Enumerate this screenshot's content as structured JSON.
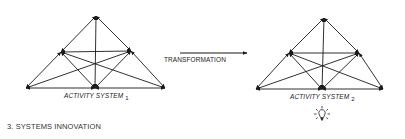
{
  "figure": {
    "caption": "3. SYSTEMS INNOVATION",
    "transformation_label": "TRANSFORMATION",
    "icon": "lightbulb-icon",
    "line_color": "#1a1a1a"
  },
  "systems": [
    {
      "label": "ACTIVITY SYSTEM",
      "subscript": "1",
      "nodes": {
        "apex": [
          96,
          16
        ],
        "mid_left": [
          61,
          52
        ],
        "mid_right": [
          131,
          51
        ],
        "base_left": [
          26,
          88
        ],
        "base_center": [
          95,
          88
        ],
        "base_right": [
          165,
          88
        ]
      }
    },
    {
      "label": "ACTIVITY SYSTEM",
      "subscript": "2",
      "nodes": {
        "apex": [
          324,
          18
        ],
        "mid_left": [
          289,
          53
        ],
        "mid_right": [
          359,
          53
        ],
        "base_left": [
          256,
          89
        ],
        "base_center": [
          322,
          89
        ],
        "base_right": [
          383,
          89
        ]
      }
    }
  ],
  "edges": [
    [
      "apex",
      "mid_left"
    ],
    [
      "apex",
      "mid_right"
    ],
    [
      "apex",
      "base_center"
    ],
    [
      "mid_left",
      "mid_right"
    ],
    [
      "mid_left",
      "base_left"
    ],
    [
      "mid_right",
      "base_right"
    ],
    [
      "base_left",
      "base_center"
    ],
    [
      "base_center",
      "base_right"
    ],
    [
      "mid_left",
      "base_center"
    ],
    [
      "mid_right",
      "base_center"
    ],
    [
      "base_left",
      "mid_right"
    ],
    [
      "mid_left",
      "base_right"
    ]
  ],
  "arrow": {
    "from": [
      180,
      53
    ],
    "to": [
      247,
      53
    ]
  }
}
